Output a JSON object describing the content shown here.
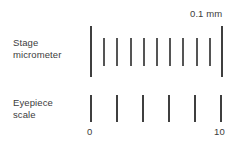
{
  "figure": {
    "width": 242,
    "height": 144,
    "background_color": "#ffffff",
    "line_color": "#4a4a4a",
    "text_color": "#3c3c3c"
  },
  "labels": {
    "stage": "Stage\nmicrometer",
    "eyepiece": "Eyepiece\nscale",
    "unit": "0.1 mm",
    "axis_left": "0",
    "axis_right": "10"
  },
  "chart_data": {
    "type": "diagram",
    "scales": [
      {
        "name": "Stage micrometer",
        "label": "Stage\nmicrometer",
        "tick_count": 11,
        "division_label": "0.1 mm",
        "division_value": 0.1,
        "division_unit": "mm",
        "total_span_mm": 1.0,
        "x_start": 90,
        "x_end": 221,
        "tick_spacing_px": 13.1,
        "ticks": [
          {
            "index": 0,
            "x": 90,
            "type": "major",
            "y_top": 26,
            "y_bottom": 77
          },
          {
            "index": 1,
            "x": 103,
            "type": "minor",
            "y_top": 38,
            "y_bottom": 66
          },
          {
            "index": 2,
            "x": 116,
            "type": "minor",
            "y_top": 38,
            "y_bottom": 66
          },
          {
            "index": 3,
            "x": 130,
            "type": "minor",
            "y_top": 38,
            "y_bottom": 66
          },
          {
            "index": 4,
            "x": 143,
            "type": "minor",
            "y_top": 38,
            "y_bottom": 66
          },
          {
            "index": 5,
            "x": 156,
            "type": "minor",
            "y_top": 38,
            "y_bottom": 66
          },
          {
            "index": 6,
            "x": 169,
            "type": "minor",
            "y_top": 38,
            "y_bottom": 66
          },
          {
            "index": 7,
            "x": 182,
            "type": "minor",
            "y_top": 38,
            "y_bottom": 66
          },
          {
            "index": 8,
            "x": 196,
            "type": "minor",
            "y_top": 38,
            "y_bottom": 66
          },
          {
            "index": 9,
            "x": 209,
            "type": "minor",
            "y_top": 38,
            "y_bottom": 66
          },
          {
            "index": 10,
            "x": 221,
            "type": "major",
            "y_top": 26,
            "y_bottom": 77
          }
        ]
      },
      {
        "name": "Eyepiece scale",
        "label": "Eyepiece\nscale",
        "tick_count": 6,
        "x_start": 90,
        "x_end": 220,
        "tick_spacing_px": 26,
        "axis_min": 0,
        "axis_max": 10,
        "tick_values": [
          0,
          2,
          4,
          6,
          8,
          10
        ],
        "labeled_ticks": [
          {
            "value": 0,
            "text": "0",
            "x": 90
          },
          {
            "value": 10,
            "text": "10",
            "x": 220
          }
        ],
        "ticks": [
          {
            "index": 0,
            "x": 90,
            "type": "major",
            "y_top": 95,
            "y_bottom": 122
          },
          {
            "index": 1,
            "x": 116,
            "type": "major",
            "y_top": 95,
            "y_bottom": 122
          },
          {
            "index": 2,
            "x": 142,
            "type": "major",
            "y_top": 95,
            "y_bottom": 122
          },
          {
            "index": 3,
            "x": 168,
            "type": "major",
            "y_top": 95,
            "y_bottom": 122
          },
          {
            "index": 4,
            "x": 194,
            "type": "major",
            "y_top": 95,
            "y_bottom": 122
          },
          {
            "index": 5,
            "x": 220,
            "type": "major",
            "y_top": 95,
            "y_bottom": 122
          }
        ]
      }
    ]
  }
}
